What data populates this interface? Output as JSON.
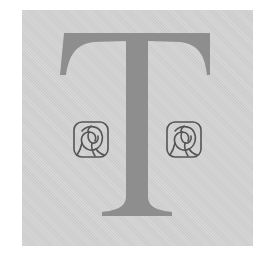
{
  "image": {
    "description": "Decorative drop-cap letter T flanked by two stylized rose ornaments",
    "letter": "T",
    "ornaments": [
      "rose-ornament",
      "rose-ornament"
    ],
    "colors": {
      "page": "#ffffff",
      "panel": "#d3d3d3",
      "letter": "#8e8e8e",
      "ornament_stroke": "#555555"
    }
  }
}
